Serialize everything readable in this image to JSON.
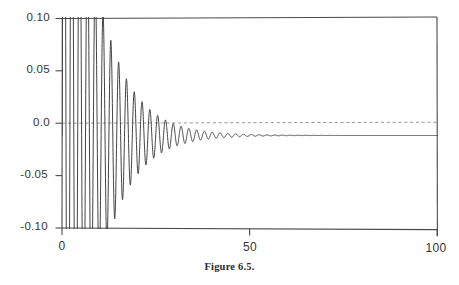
{
  "figure": {
    "caption": "Figure 6.5."
  },
  "chart_data": {
    "type": "line",
    "title": "",
    "subtitle": "",
    "xlabel": "",
    "ylabel": "",
    "xlim": [
      0,
      100
    ],
    "ylim": [
      -0.1,
      0.1
    ],
    "grid": "zero-line-dashed-only",
    "legend": "none",
    "x_ticks": [
      0,
      50,
      100
    ],
    "x_tick_labels": [
      "0",
      "50",
      "100"
    ],
    "y_ticks": [
      0.1,
      0.05,
      0.0,
      -0.05,
      -0.1
    ],
    "y_tick_labels": [
      "0.10",
      "0.05",
      "0.0",
      "-0.05",
      "-0.10"
    ],
    "line_color": "#3a3a3a",
    "series": [
      {
        "name": "response",
        "model": "damped_sine",
        "amplitude": 0.46,
        "decay_rate": 0.125,
        "period": 2.08,
        "phase": 0.0,
        "offset": -0.0115,
        "clipped_cycles": 5,
        "x_start": 0,
        "x_end": 100,
        "samples": 3000,
        "final_amplitude": 0.005,
        "final_value": -0.0115
      }
    ],
    "annotations": []
  },
  "axes": {
    "frame_color": "#4a4a4a",
    "zero_line_color": "#8a8a8a"
  }
}
